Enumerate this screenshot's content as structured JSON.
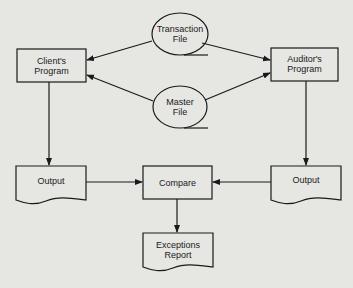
{
  "diagram": {
    "nodes": {
      "transaction_file": {
        "label": "Transaction\nFile",
        "shape": "file-ellipse"
      },
      "master_file": {
        "label": "Master\nFile",
        "shape": "file-ellipse"
      },
      "clients_program": {
        "label": "Client's\nProgram",
        "shape": "process"
      },
      "auditors_program": {
        "label": "Auditor's\nProgram",
        "shape": "process"
      },
      "output_left": {
        "label": "Output",
        "shape": "document"
      },
      "compare": {
        "label": "Compare",
        "shape": "process"
      },
      "output_right": {
        "label": "Output",
        "shape": "document"
      },
      "exceptions_report": {
        "label": "Exceptions\nReport",
        "shape": "document"
      }
    },
    "edges": [
      {
        "from": "transaction_file",
        "to": "clients_program"
      },
      {
        "from": "transaction_file",
        "to": "auditors_program"
      },
      {
        "from": "master_file",
        "to": "clients_program"
      },
      {
        "from": "master_file",
        "to": "auditors_program"
      },
      {
        "from": "clients_program",
        "to": "output_left"
      },
      {
        "from": "auditors_program",
        "to": "output_right"
      },
      {
        "from": "output_left",
        "to": "compare"
      },
      {
        "from": "output_right",
        "to": "compare"
      },
      {
        "from": "compare",
        "to": "exceptions_report"
      }
    ],
    "colors": {
      "background": "#e6e6e3",
      "stroke": "#1a1a1a"
    }
  }
}
